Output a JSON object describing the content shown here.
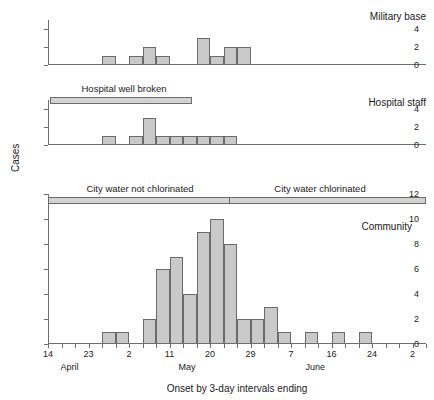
{
  "figure": {
    "y_axis_title": "Cases",
    "x_axis_title": "Onset by 3-day intervals ending"
  },
  "chart_data": {
    "type": "bar",
    "title": "Onset by 3-day intervals ending",
    "xlabel": "Onset by 3-day intervals ending",
    "ylabel": "Cases",
    "grid": false,
    "legend": "none",
    "x_tick_labels": [
      "14",
      "",
      "",
      "23",
      "",
      "",
      "2",
      "",
      "",
      "11",
      "",
      "",
      "20",
      "",
      "",
      "29",
      "",
      "",
      "7",
      "",
      "",
      "16",
      "",
      "",
      "24",
      "",
      "",
      "2"
    ],
    "x_major_labels": [
      {
        "index": 0,
        "label": "14"
      },
      {
        "index": 3,
        "label": "23"
      },
      {
        "index": 6,
        "label": "2"
      },
      {
        "index": 9,
        "label": "11"
      },
      {
        "index": 12,
        "label": "20"
      },
      {
        "index": 15,
        "label": "29"
      },
      {
        "index": 18,
        "label": "7"
      },
      {
        "index": 21,
        "label": "16"
      },
      {
        "index": 24,
        "label": "24"
      },
      {
        "index": 27,
        "label": "2"
      }
    ],
    "month_labels": [
      {
        "index": 1.6,
        "label": "April"
      },
      {
        "index": 10.3,
        "label": "May"
      },
      {
        "index": 19.8,
        "label": "June"
      }
    ],
    "n_bins": 28,
    "panels": [
      {
        "name": "military-base",
        "caption": "Military base",
        "ylim": [
          0,
          5
        ],
        "y_ticks": [
          0,
          2,
          4
        ],
        "values": [
          0,
          0,
          0,
          0,
          1,
          0,
          1,
          2,
          1,
          0,
          0,
          3,
          1,
          2,
          2,
          0,
          0,
          0,
          0,
          0,
          0,
          0,
          0,
          0,
          0,
          0,
          0,
          0
        ]
      },
      {
        "name": "hospital-staff",
        "caption": "Hospital staff",
        "ylim": [
          0,
          5
        ],
        "y_ticks": [
          0,
          2,
          4
        ],
        "values": [
          0,
          0,
          0,
          0,
          1,
          0,
          1,
          3,
          1,
          1,
          1,
          1,
          1,
          1,
          0,
          0,
          0,
          0,
          0,
          0,
          0,
          0,
          0,
          0,
          0,
          0,
          0,
          0
        ],
        "annotation": {
          "label": "Hospital well broken",
          "start_index": 0.6,
          "end_index": 9.2
        }
      },
      {
        "name": "community",
        "caption": "Community",
        "ylim": [
          0,
          12
        ],
        "y_ticks": [
          0,
          2,
          4,
          6,
          8,
          10,
          12
        ],
        "values": [
          0,
          0,
          0,
          0,
          1,
          1,
          0,
          2,
          6,
          7,
          4,
          9,
          10,
          8,
          2,
          2,
          3,
          1,
          0,
          1,
          0,
          1,
          0,
          1,
          0,
          0,
          0,
          0
        ],
        "annotation_segments": [
          {
            "label": "City water not chlorinated",
            "start_index": 0,
            "end_index": 13.4
          },
          {
            "label": "City water chlorinated",
            "start_index": 13.4,
            "end_index": 27.6
          }
        ]
      }
    ]
  }
}
